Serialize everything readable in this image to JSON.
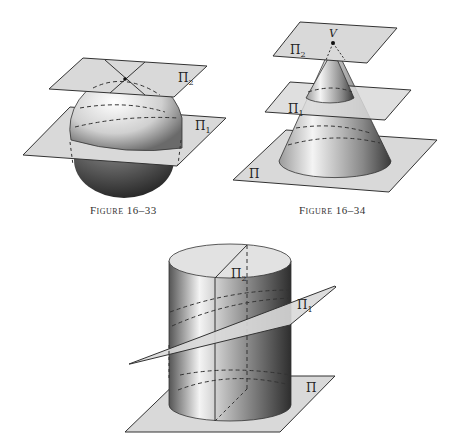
{
  "figures": [
    {
      "id": "fig-16-33",
      "caption": "Figure 16–33",
      "solid": "sphere",
      "plane_labels": [
        "Π₂",
        "Π₁"
      ]
    },
    {
      "id": "fig-16-34",
      "caption": "Figure 16–34",
      "solid": "cone",
      "vertex_label": "V",
      "plane_labels": [
        "Π₂",
        "Π₁",
        "Π"
      ]
    },
    {
      "id": "fig-16-35",
      "caption": "",
      "solid": "cylinder",
      "plane_labels": [
        "Π₂",
        "Π₁",
        "Π"
      ]
    }
  ],
  "colors": {
    "plane_fill": "#d9d9d9",
    "plane_stroke": "#333333",
    "solid_light": "#ffffff",
    "solid_dark": "#3a3a3a"
  }
}
